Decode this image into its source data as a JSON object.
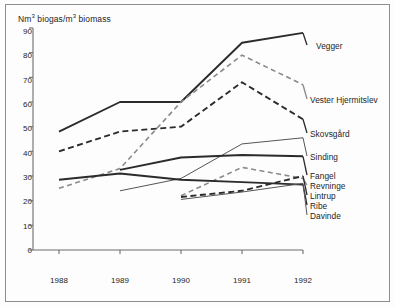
{
  "figure": {
    "y_axis_title": "Nm³ biogas/m³ biomass",
    "y_axis_title_parts": {
      "prefix": "Nm",
      "sup1": "3",
      "mid": " biogas/m",
      "sup2": "3",
      "suffix": " biomass"
    }
  },
  "chart_data": {
    "type": "line",
    "title": "",
    "xlabel": "",
    "ylabel": "Nm³ biogas/m³ biomass",
    "x": [
      1988,
      1989,
      1990,
      1991,
      1992
    ],
    "xtick_labels": [
      "1988",
      "1989",
      "1990",
      "1991",
      "1992"
    ],
    "ytick_labels": [
      "0",
      "10",
      "20",
      "30",
      "40",
      "50",
      "60",
      "70",
      "80",
      "90"
    ],
    "yticks": [
      0,
      10,
      20,
      30,
      40,
      50,
      60,
      70,
      80,
      90
    ],
    "ylim": [
      0,
      90
    ],
    "xlim": [
      1988,
      1992
    ],
    "grid": false,
    "legend_position": "right-inline-labels",
    "series": [
      {
        "name": "Vegger",
        "values": [
          48,
          60,
          60,
          84,
          88
        ],
        "style": "solid",
        "width": 1.9,
        "color": "#2b2b2b",
        "label_y": 88
      },
      {
        "name": "Vester Hjermitslev",
        "values": [
          25,
          33,
          60,
          79,
          67
        ],
        "style": "dashed",
        "width": 1.6,
        "color": "#8a8a8a",
        "label_y": 67
      },
      {
        "name": "Skovsgård",
        "values": [
          40,
          48,
          50,
          68,
          53
        ],
        "style": "dashed",
        "width": 1.9,
        "color": "#2b2b2b",
        "label_y": 53
      },
      {
        "name": "Sinding",
        "values": [
          null,
          24,
          29,
          43,
          45.5
        ],
        "style": "solid",
        "width": 1.0,
        "color": "#555555",
        "label_y": 45.5
      },
      {
        "name": "Fangel",
        "values": [
          null,
          32.5,
          37.5,
          38.5,
          38
        ],
        "style": "solid",
        "width": 1.9,
        "color": "#2b2b2b",
        "label_y": 38
      },
      {
        "name": "Revninge",
        "values": [
          null,
          null,
          22,
          33.5,
          29
        ],
        "style": "dashed",
        "width": 1.6,
        "color": "#8a8a8a",
        "label_y": 33
      },
      {
        "name": "Lintrup",
        "values": [
          null,
          null,
          21.5,
          24,
          30
        ],
        "style": "dashed",
        "width": 1.9,
        "color": "#2b2b2b",
        "label_y": 30
      },
      {
        "name": "Ribe",
        "values": [
          28.5,
          31,
          28.5,
          27.5,
          26.5
        ],
        "style": "solid",
        "width": 1.9,
        "color": "#2b2b2b",
        "label_y": 27.5
      },
      {
        "name": "Davinde",
        "values": [
          null,
          null,
          20.5,
          23.5,
          27
        ],
        "style": "solid",
        "width": 1.0,
        "color": "#555555",
        "label_y": 24.5
      }
    ]
  },
  "labels": {
    "vegger": "Vegger",
    "vester_hjermitslev": "Vester Hjermitslev",
    "skovsgaard": "Skovsgård",
    "sinding": "Sinding",
    "fangel": "Fangel",
    "revninge": "Revninge",
    "lintrup": "Lintrup",
    "ribe": "Ribe",
    "davinde": "Davinde"
  }
}
